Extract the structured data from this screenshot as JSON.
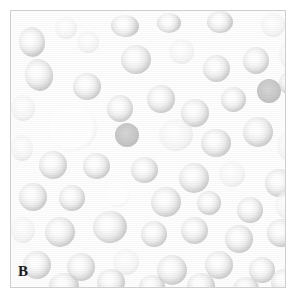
{
  "figure": {
    "panel_label": "B",
    "modality": "light-microscopy-blood-smear",
    "field_background_color": "#fdfdfd",
    "frame_border_color": "#cfcfcf",
    "page_background_color": "#ffffff",
    "label_color": "#1a1a1a"
  },
  "frame": {
    "left": 10,
    "top": 10,
    "width": 276,
    "height": 278
  },
  "cell_palette": {
    "biconcave_rim": "#bcbcbc",
    "biconcave_pallor": "#ffffff",
    "dense_cell": "#b8b8b8",
    "ghost_cell_rim": "#e2e2e2",
    "pale_cell_rim": "#dcdcdc"
  },
  "cells": [
    {
      "x": 8,
      "y": 16,
      "w": 26,
      "h": 30,
      "type": "biconcave",
      "rot": -8
    },
    {
      "x": 44,
      "y": 6,
      "w": 22,
      "h": 22,
      "type": "pale",
      "rot": 0
    },
    {
      "x": 100,
      "y": 4,
      "w": 28,
      "h": 22,
      "type": "biconcave",
      "rot": 4
    },
    {
      "x": 146,
      "y": 2,
      "w": 24,
      "h": 20,
      "type": "biconcave",
      "rot": 0
    },
    {
      "x": 196,
      "y": 0,
      "w": 26,
      "h": 22,
      "type": "biconcave",
      "rot": 0
    },
    {
      "x": 250,
      "y": 2,
      "w": 24,
      "h": 24,
      "type": "pale",
      "rot": 0
    },
    {
      "x": 14,
      "y": 48,
      "w": 28,
      "h": 32,
      "type": "biconcave",
      "rot": -12
    },
    {
      "x": 62,
      "y": 62,
      "w": 28,
      "h": 27,
      "type": "biconcave",
      "rot": 0
    },
    {
      "x": 110,
      "y": 34,
      "w": 30,
      "h": 29,
      "type": "biconcave",
      "rot": 0
    },
    {
      "x": 158,
      "y": 28,
      "w": 25,
      "h": 25,
      "type": "pale",
      "rot": 0
    },
    {
      "x": 192,
      "y": 44,
      "w": 27,
      "h": 27,
      "type": "biconcave",
      "rot": 0
    },
    {
      "x": 232,
      "y": 36,
      "w": 26,
      "h": 27,
      "type": "biconcave",
      "rot": 0
    },
    {
      "x": 268,
      "y": 30,
      "w": 26,
      "h": 28,
      "type": "pale",
      "rot": 0
    },
    {
      "x": 0,
      "y": 84,
      "w": 24,
      "h": 26,
      "type": "pale",
      "rot": 0
    },
    {
      "x": 38,
      "y": 96,
      "w": 48,
      "h": 44,
      "type": "ghost",
      "rot": -6
    },
    {
      "x": 96,
      "y": 84,
      "w": 26,
      "h": 27,
      "type": "biconcave",
      "rot": 0
    },
    {
      "x": 136,
      "y": 74,
      "w": 28,
      "h": 28,
      "type": "biconcave",
      "rot": 0
    },
    {
      "x": 170,
      "y": 88,
      "w": 28,
      "h": 28,
      "type": "biconcave",
      "rot": 0
    },
    {
      "x": 210,
      "y": 76,
      "w": 25,
      "h": 25,
      "type": "biconcave",
      "rot": 0
    },
    {
      "x": 246,
      "y": 68,
      "w": 24,
      "h": 24,
      "type": "dense",
      "rot": 0
    },
    {
      "x": 0,
      "y": 124,
      "w": 22,
      "h": 26,
      "type": "pale",
      "rot": 0
    },
    {
      "x": 104,
      "y": 112,
      "w": 24,
      "h": 24,
      "type": "dense",
      "rot": 0
    },
    {
      "x": 148,
      "y": 108,
      "w": 34,
      "h": 32,
      "type": "pale",
      "rot": -10
    },
    {
      "x": 190,
      "y": 118,
      "w": 30,
      "h": 28,
      "type": "biconcave",
      "rot": 0
    },
    {
      "x": 232,
      "y": 106,
      "w": 30,
      "h": 30,
      "type": "biconcave",
      "rot": 0
    },
    {
      "x": 266,
      "y": 120,
      "w": 28,
      "h": 30,
      "type": "pale",
      "rot": 0
    },
    {
      "x": 28,
      "y": 140,
      "w": 28,
      "h": 28,
      "type": "biconcave",
      "rot": 0
    },
    {
      "x": 72,
      "y": 142,
      "w": 27,
      "h": 26,
      "type": "biconcave",
      "rot": 0
    },
    {
      "x": 120,
      "y": 146,
      "w": 27,
      "h": 26,
      "type": "biconcave",
      "rot": 0
    },
    {
      "x": 168,
      "y": 152,
      "w": 30,
      "h": 30,
      "type": "biconcave",
      "rot": 0
    },
    {
      "x": 208,
      "y": 150,
      "w": 26,
      "h": 26,
      "type": "pale",
      "rot": 0
    },
    {
      "x": 254,
      "y": 158,
      "w": 28,
      "h": 28,
      "type": "biconcave",
      "rot": 0
    },
    {
      "x": 8,
      "y": 172,
      "w": 28,
      "h": 28,
      "type": "biconcave",
      "rot": 0
    },
    {
      "x": 48,
      "y": 174,
      "w": 26,
      "h": 26,
      "type": "biconcave",
      "rot": 0
    },
    {
      "x": 96,
      "y": 172,
      "w": 22,
      "h": 24,
      "type": "ghost",
      "rot": 0
    },
    {
      "x": 140,
      "y": 176,
      "w": 30,
      "h": 30,
      "type": "biconcave",
      "rot": 0
    },
    {
      "x": 186,
      "y": 180,
      "w": 24,
      "h": 24,
      "type": "biconcave",
      "rot": 0
    },
    {
      "x": 226,
      "y": 186,
      "w": 26,
      "h": 26,
      "type": "biconcave",
      "rot": 0
    },
    {
      "x": 264,
      "y": 180,
      "w": 26,
      "h": 28,
      "type": "pale",
      "rot": 0
    },
    {
      "x": 0,
      "y": 206,
      "w": 24,
      "h": 26,
      "type": "pale",
      "rot": 0
    },
    {
      "x": 34,
      "y": 206,
      "w": 30,
      "h": 30,
      "type": "biconcave",
      "rot": 0
    },
    {
      "x": 82,
      "y": 200,
      "w": 34,
      "h": 32,
      "type": "biconcave",
      "rot": -6
    },
    {
      "x": 130,
      "y": 210,
      "w": 26,
      "h": 26,
      "type": "biconcave",
      "rot": 0
    },
    {
      "x": 170,
      "y": 206,
      "w": 27,
      "h": 27,
      "type": "biconcave",
      "rot": 0
    },
    {
      "x": 214,
      "y": 214,
      "w": 28,
      "h": 28,
      "type": "biconcave",
      "rot": 0
    },
    {
      "x": 256,
      "y": 208,
      "w": 28,
      "h": 28,
      "type": "biconcave",
      "rot": 0
    },
    {
      "x": 12,
      "y": 240,
      "w": 28,
      "h": 28,
      "type": "biconcave",
      "rot": 0
    },
    {
      "x": 56,
      "y": 242,
      "w": 28,
      "h": 28,
      "type": "biconcave",
      "rot": 0
    },
    {
      "x": 102,
      "y": 238,
      "w": 26,
      "h": 26,
      "type": "pale",
      "rot": 0
    },
    {
      "x": 146,
      "y": 244,
      "w": 30,
      "h": 30,
      "type": "biconcave",
      "rot": 0
    },
    {
      "x": 194,
      "y": 240,
      "w": 28,
      "h": 28,
      "type": "biconcave",
      "rot": 0
    },
    {
      "x": 238,
      "y": 246,
      "w": 26,
      "h": 26,
      "type": "biconcave",
      "rot": 0
    },
    {
      "x": 38,
      "y": 262,
      "w": 30,
      "h": 26,
      "type": "biconcave",
      "rot": 0
    },
    {
      "x": 86,
      "y": 258,
      "w": 28,
      "h": 26,
      "type": "biconcave",
      "rot": 0
    },
    {
      "x": 128,
      "y": 264,
      "w": 26,
      "h": 24,
      "type": "biconcave",
      "rot": 0
    },
    {
      "x": 176,
      "y": 262,
      "w": 28,
      "h": 26,
      "type": "biconcave",
      "rot": 0
    },
    {
      "x": 222,
      "y": 266,
      "w": 26,
      "h": 24,
      "type": "biconcave",
      "rot": 0
    },
    {
      "x": 260,
      "y": 258,
      "w": 26,
      "h": 26,
      "type": "biconcave",
      "rot": 0
    },
    {
      "x": 66,
      "y": 20,
      "w": 22,
      "h": 22,
      "type": "pale",
      "rot": 0
    },
    {
      "x": 268,
      "y": 60,
      "w": 24,
      "h": 24,
      "type": "biconcave",
      "rot": 0
    }
  ]
}
